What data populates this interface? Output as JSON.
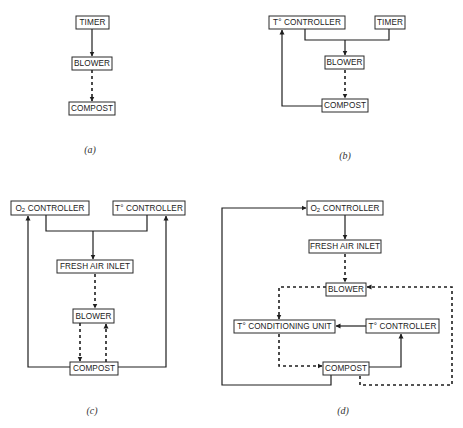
{
  "figure": {
    "panels": [
      {
        "id": "a",
        "label": "(a)",
        "nodes": {
          "timer": "TIMER",
          "blower": "BLOWER",
          "compost": "COMPOST"
        }
      },
      {
        "id": "b",
        "label": "(b)",
        "nodes": {
          "t_controller": "T° CONTROLLER",
          "timer": "TIMER",
          "blower": "BLOWER",
          "compost": "COMPOST"
        }
      },
      {
        "id": "c",
        "label": "(c)",
        "nodes": {
          "o2_controller_prefix": "O",
          "o2_controller_sub": "2",
          "o2_controller_rest": " CONTROLLER",
          "t_controller": "T° CONTROLLER",
          "fresh_air_inlet": "FRESH AIR INLET",
          "blower": "BLOWER",
          "compost": "COMPOST"
        }
      },
      {
        "id": "d",
        "label": "(d)",
        "nodes": {
          "o2_controller_prefix": "O",
          "o2_controller_sub": "2",
          "o2_controller_rest": " CONTROLLER",
          "fresh_air_inlet": "FRESH AIR INLET",
          "blower": "BLOWER",
          "t_conditioning_unit": "T° CONDITIONING UNIT",
          "t_controller": "T° CONTROLLER",
          "compost": "COMPOST"
        }
      }
    ],
    "legend": {
      "solid_line": "control signal",
      "dashed_line": "air flow"
    }
  }
}
